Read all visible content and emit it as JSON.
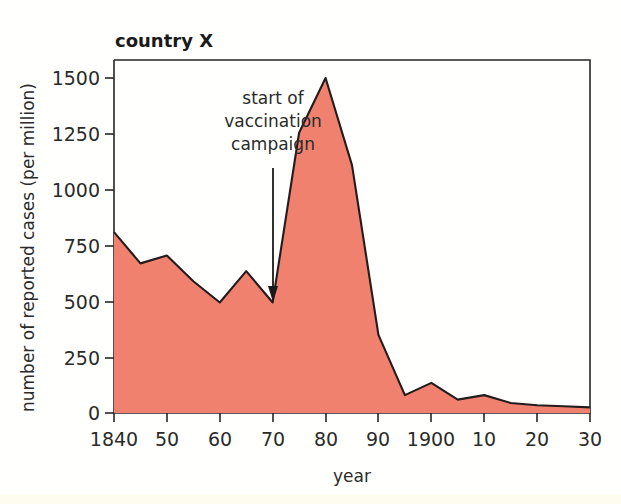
{
  "figure": {
    "title": "country X",
    "background_color": "#fffffd"
  },
  "chart_data": {
    "type": "area",
    "title": "country X",
    "xlabel": "year",
    "ylabel": "number of reported cases (per million)",
    "x": [
      1840,
      1845,
      1850,
      1855,
      1860,
      1865,
      1870,
      1875,
      1880,
      1885,
      1890,
      1895,
      1900,
      1905,
      1910,
      1915,
      1920,
      1925,
      1930
    ],
    "values": [
      810,
      670,
      705,
      590,
      495,
      635,
      495,
      1255,
      1500,
      1110,
      350,
      80,
      135,
      60,
      80,
      45,
      35,
      30,
      25
    ],
    "x_tick_positions": [
      1840,
      1850,
      1860,
      1870,
      1880,
      1890,
      1900,
      1910,
      1920,
      1930
    ],
    "x_tick_labels": [
      "1840",
      "50",
      "60",
      "70",
      "80",
      "90",
      "1900",
      "10",
      "20",
      "30"
    ],
    "y_tick_values": [
      0,
      250,
      500,
      750,
      1000,
      1250,
      1500
    ],
    "y_tick_labels": [
      "0",
      "250",
      "500",
      "750",
      "1000",
      "1250",
      "1500"
    ],
    "xlim": [
      1840,
      1930
    ],
    "ylim": [
      0,
      1600
    ],
    "grid": false,
    "legend": null,
    "area_fill_color": "#f0816f",
    "line_color": "#241c1c",
    "annotations": [
      {
        "name": "start-of-vaccination-campaign",
        "lines": [
          "start of",
          "vaccination",
          "campaign"
        ],
        "points_to_year": 1870,
        "arrow_direction": "down"
      }
    ]
  },
  "axes": {
    "y_title": "number of reported cases (per million)",
    "x_title": "year",
    "y_ticks": [
      "1500",
      "1250",
      "1000",
      "750",
      "500",
      "250",
      "0"
    ],
    "x_ticks": [
      "1840",
      "50",
      "60",
      "70",
      "80",
      "90",
      "1900",
      "10",
      "20",
      "30"
    ]
  },
  "annotation": {
    "line1": "start of",
    "line2": "vaccination",
    "line3": "campaign"
  }
}
